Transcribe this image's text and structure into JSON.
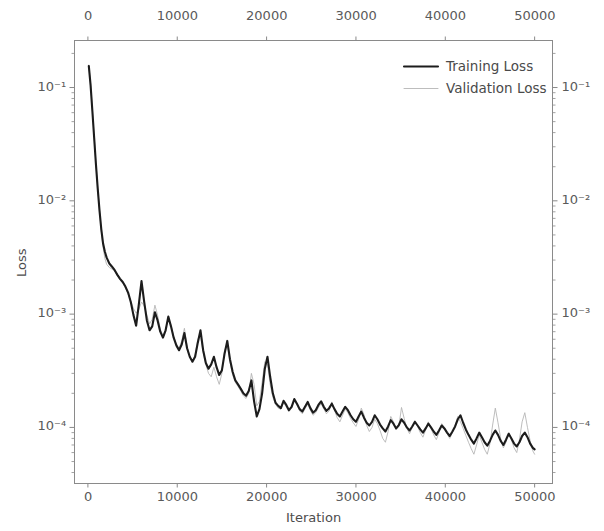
{
  "chart_data": {
    "type": "line",
    "title": "",
    "xlabel": "Iteration",
    "ylabel": "Loss",
    "xlabel_top": "",
    "ylabel_right": "",
    "yscale": "log",
    "xscale": "linear",
    "xlim": [
      -1500,
      52000
    ],
    "ylim": [
      3.2e-05,
      0.26
    ],
    "grid": false,
    "legend_position": "upper right",
    "xticks": [
      0,
      10000,
      20000,
      30000,
      40000,
      50000
    ],
    "xtick_labels": [
      "0",
      "10000",
      "20000",
      "30000",
      "40000",
      "50000"
    ],
    "xticks_top": [
      0,
      10000,
      20000,
      30000,
      40000,
      50000
    ],
    "xtick_labels_top": [
      "0",
      "10000",
      "20000",
      "30000",
      "40000",
      "50000"
    ],
    "yticks": [
      0.1,
      0.01,
      0.001,
      0.0001
    ],
    "ytick_labels": [
      "10⁻¹",
      "10⁻²",
      "10⁻³",
      "10⁻⁴"
    ],
    "ytick_exponents": [
      "-1",
      "-2",
      "-3",
      "-4"
    ],
    "ytick_labels_right": [
      "10⁻¹",
      "10⁻²",
      "10⁻³",
      "10⁻⁴"
    ],
    "colors": {
      "training": "#1c1c1c",
      "validation": "#b5b5b5",
      "axis": "#8a8a8a",
      "text": "#4d4d4d",
      "background": "#ffffff"
    },
    "linewidths": {
      "training": 2.1,
      "validation": 0.9
    },
    "series": [
      {
        "name": "Training Loss",
        "color": "#1c1c1c",
        "linewidth": 2.1,
        "x": [
          100,
          300,
          500,
          700,
          900,
          1100,
          1300,
          1500,
          1700,
          1900,
          2100,
          2400,
          2700,
          3000,
          3300,
          3600,
          3900,
          4200,
          4500,
          4800,
          5100,
          5400,
          5700,
          6000,
          6300,
          6600,
          6900,
          7200,
          7500,
          7800,
          8100,
          8400,
          8700,
          9000,
          9300,
          9600,
          9900,
          10200,
          10500,
          10800,
          11100,
          11400,
          11700,
          12000,
          12300,
          12600,
          12900,
          13200,
          13500,
          13800,
          14100,
          14400,
          14700,
          15000,
          15300,
          15600,
          15900,
          16200,
          16500,
          16800,
          17100,
          17400,
          17700,
          18000,
          18300,
          18600,
          18900,
          19200,
          19500,
          19800,
          20100,
          20400,
          20700,
          21000,
          21300,
          21600,
          21900,
          22200,
          22500,
          22800,
          23100,
          23400,
          23700,
          24000,
          24300,
          24600,
          24900,
          25200,
          25500,
          25800,
          26100,
          26400,
          26700,
          27000,
          27300,
          27600,
          27900,
          28200,
          28500,
          28800,
          29100,
          29400,
          29700,
          30000,
          30300,
          30600,
          30900,
          31200,
          31500,
          31800,
          32100,
          32400,
          32700,
          33000,
          33300,
          33600,
          33900,
          34200,
          34500,
          34800,
          35100,
          35400,
          35700,
          36000,
          36300,
          36600,
          36900,
          37200,
          37500,
          37800,
          38100,
          38400,
          38700,
          39000,
          39300,
          39600,
          39900,
          40200,
          40500,
          40800,
          41100,
          41400,
          41700,
          42000,
          42300,
          42600,
          42900,
          43200,
          43500,
          43800,
          44100,
          44400,
          44700,
          45000,
          45300,
          45600,
          45900,
          46200,
          46500,
          46800,
          47100,
          47400,
          47700,
          48000,
          48300,
          48600,
          48900,
          49200,
          49500,
          49800,
          50000
        ],
        "y": [
          0.155,
          0.105,
          0.062,
          0.036,
          0.021,
          0.0128,
          0.0082,
          0.0056,
          0.0042,
          0.00355,
          0.00315,
          0.0028,
          0.00262,
          0.00244,
          0.00222,
          0.00205,
          0.00192,
          0.00175,
          0.00155,
          0.00128,
          0.00098,
          0.00079,
          0.00122,
          0.00196,
          0.00128,
          0.00088,
          0.00072,
          0.00078,
          0.00104,
          0.00088,
          0.0007,
          0.00062,
          0.00072,
          0.00095,
          0.00078,
          0.00062,
          0.00053,
          0.00048,
          0.00054,
          0.00068,
          0.0005,
          0.00042,
          0.00038,
          0.00042,
          0.00056,
          0.00072,
          0.00048,
          0.00037,
          0.00033,
          0.00036,
          0.00042,
          0.00034,
          0.00029,
          0.00032,
          0.00045,
          0.00058,
          0.0004,
          0.00031,
          0.00026,
          0.00024,
          0.00022,
          0.0002,
          0.00019,
          0.00021,
          0.00026,
          0.00017,
          0.000125,
          0.000145,
          0.0002,
          0.00033,
          0.00042,
          0.00028,
          0.0002,
          0.000165,
          0.000155,
          0.000148,
          0.000172,
          0.000158,
          0.000142,
          0.000152,
          0.000178,
          0.000162,
          0.000145,
          0.000138,
          0.000152,
          0.000168,
          0.000148,
          0.000135,
          0.000142,
          0.000158,
          0.00017,
          0.000152,
          0.00014,
          0.000148,
          0.000162,
          0.000145,
          0.000132,
          0.000125,
          0.000138,
          0.000152,
          0.000142,
          0.000128,
          0.000118,
          0.000112,
          0.000125,
          0.000138,
          0.000122,
          0.00011,
          0.000104,
          0.000112,
          0.000128,
          0.000118,
          0.000106,
          9.8e-05,
          9.2e-05,
          0.000102,
          0.000116,
          0.000108,
          9.8e-05,
          0.000105,
          0.000118,
          0.00011,
          0.0001,
          9.4e-05,
          0.000102,
          0.000112,
          0.000104,
          9.6e-05,
          9e-05,
          9.8e-05,
          0.000108,
          0.0001,
          9.2e-05,
          8.6e-05,
          9.4e-05,
          0.000104,
          9.8e-05,
          9e-05,
          8.4e-05,
          9.2e-05,
          0.000102,
          0.000118,
          0.000128,
          0.00011,
          9.6e-05,
          8.6e-05,
          7.8e-05,
          7.2e-05,
          8e-05,
          9e-05,
          8.2e-05,
          7.4e-05,
          6.9e-05,
          7.6e-05,
          8.6e-05,
          9.4e-05,
          8.6e-05,
          7.6e-05,
          7e-05,
          7.8e-05,
          8.8e-05,
          8e-05,
          7.2e-05,
          6.8e-05,
          7.4e-05,
          8.4e-05,
          9e-05,
          8.2e-05,
          7.2e-05,
          6.6e-05,
          6.4e-05
        ]
      },
      {
        "name": "Validation Loss",
        "color": "#b5b5b5",
        "linewidth": 0.9,
        "x": [
          100,
          300,
          500,
          700,
          900,
          1100,
          1300,
          1500,
          1700,
          1900,
          2100,
          2400,
          2700,
          3000,
          3300,
          3600,
          3900,
          4200,
          4500,
          4800,
          5100,
          5400,
          5700,
          6000,
          6300,
          6600,
          6900,
          7200,
          7500,
          7800,
          8100,
          8400,
          8700,
          9000,
          9300,
          9600,
          9900,
          10200,
          10500,
          10800,
          11100,
          11400,
          11700,
          12000,
          12300,
          12600,
          12900,
          13200,
          13500,
          13800,
          14100,
          14400,
          14700,
          15000,
          15300,
          15600,
          15900,
          16200,
          16500,
          16800,
          17100,
          17400,
          17700,
          18000,
          18300,
          18600,
          18900,
          19200,
          19500,
          19800,
          20100,
          20400,
          20700,
          21000,
          21300,
          21600,
          21900,
          22200,
          22500,
          22800,
          23100,
          23400,
          23700,
          24000,
          24300,
          24600,
          24900,
          25200,
          25500,
          25800,
          26100,
          26400,
          26700,
          27000,
          27300,
          27600,
          27900,
          28200,
          28500,
          28800,
          29100,
          29400,
          29700,
          30000,
          30300,
          30600,
          30900,
          31200,
          31500,
          31800,
          32100,
          32400,
          32700,
          33000,
          33300,
          33600,
          33900,
          34200,
          34500,
          34800,
          35100,
          35400,
          35700,
          36000,
          36300,
          36600,
          36900,
          37200,
          37500,
          37800,
          38100,
          38400,
          38700,
          39000,
          39300,
          39600,
          39900,
          40200,
          40500,
          40800,
          41100,
          41400,
          41700,
          42000,
          42300,
          42600,
          42900,
          43200,
          43500,
          43800,
          44100,
          44400,
          44700,
          45000,
          45300,
          45600,
          45900,
          46200,
          46500,
          46800,
          47100,
          47400,
          47700,
          48000,
          48300,
          48600,
          48900,
          49200,
          49500,
          49800,
          50000
        ],
        "y": [
          0.158,
          0.108,
          0.064,
          0.037,
          0.0215,
          0.013,
          0.0083,
          0.0054,
          0.0039,
          0.0031,
          0.00275,
          0.00258,
          0.0025,
          0.0024,
          0.00218,
          0.002,
          0.00188,
          0.0017,
          0.0015,
          0.0013,
          0.00112,
          0.00102,
          0.0011,
          0.00128,
          0.00118,
          0.00098,
          0.00082,
          0.0009,
          0.0012,
          0.00098,
          0.00074,
          0.00064,
          0.00074,
          0.00092,
          0.0008,
          0.00064,
          0.00054,
          0.0005,
          0.00058,
          0.00075,
          0.00052,
          0.00042,
          0.00038,
          0.00044,
          0.0006,
          0.00066,
          0.00046,
          0.00036,
          0.0003,
          0.00028,
          0.00034,
          0.00028,
          0.00024,
          0.0003,
          0.00048,
          0.00054,
          0.00038,
          0.00029,
          0.00025,
          0.00023,
          0.00021,
          0.00019,
          0.00018,
          0.0002,
          0.0003,
          0.00024,
          0.000155,
          0.00017,
          0.00025,
          0.00038,
          0.00036,
          0.00024,
          0.000185,
          0.00016,
          0.000148,
          0.000145,
          0.000165,
          0.000152,
          0.000138,
          0.000148,
          0.000172,
          0.000158,
          0.00014,
          0.000132,
          0.000146,
          0.00016,
          0.000142,
          0.000128,
          0.000135,
          0.00015,
          0.000162,
          0.000146,
          0.000132,
          0.00014,
          0.000168,
          0.000142,
          0.000122,
          0.000112,
          0.000128,
          0.000145,
          0.000135,
          0.00012,
          0.00011,
          0.000102,
          0.000118,
          0.000148,
          0.00013,
          0.000104,
          9.2e-05,
          0.0001,
          0.000118,
          0.000108,
          9.4e-05,
          8e-05,
          7.4e-05,
          9.2e-05,
          0.000125,
          0.000112,
          9.6e-05,
          0.000102,
          0.00015,
          0.00012,
          9.8e-05,
          8.8e-05,
          0.0001,
          0.000115,
          0.000102,
          9e-05,
          8.2e-05,
          9.5e-05,
          0.000112,
          9.8e-05,
          8.6e-05,
          7.8e-05,
          9e-05,
          0.000108,
          0.0001,
          8.8e-05,
          8e-05,
          9e-05,
          0.000104,
          0.000125,
          0.000112,
          9.8e-05,
          8.5e-05,
          7.4e-05,
          6.5e-05,
          5.8e-05,
          7e-05,
          8.6e-05,
          7.4e-05,
          6.4e-05,
          5.8e-05,
          7.2e-05,
          0.000105,
          0.000148,
          0.00011,
          8e-05,
          6.6e-05,
          7.4e-05,
          9e-05,
          7.8e-05,
          6.6e-05,
          6e-05,
          7.8e-05,
          0.000112,
          0.000135,
          0.0001,
          7.6e-05,
          6.2e-05,
          5.8e-05
        ]
      }
    ]
  },
  "legend": {
    "entries": [
      {
        "label": "Training Loss"
      },
      {
        "label": "Validation Loss"
      }
    ]
  },
  "axes": {
    "xlabel_bottom": "Iteration",
    "ylabel_left": "Loss"
  }
}
